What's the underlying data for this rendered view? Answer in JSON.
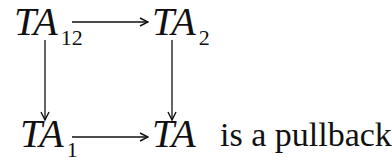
{
  "diagram": {
    "type": "commutative-square",
    "nodes": {
      "top_left": {
        "base": "TA",
        "sub": "12"
      },
      "top_right": {
        "base": "TA",
        "sub": "2"
      },
      "bottom_left": {
        "base": "TA",
        "sub": "1"
      },
      "bottom_right": {
        "base": "TA",
        "sub": ""
      }
    },
    "edges": [
      {
        "from": "top_left",
        "to": "top_right",
        "direction": "right"
      },
      {
        "from": "top_left",
        "to": "bottom_left",
        "direction": "down"
      },
      {
        "from": "top_right",
        "to": "bottom_right",
        "direction": "down"
      },
      {
        "from": "bottom_left",
        "to": "bottom_right",
        "direction": "right"
      }
    ],
    "caption": "is a pullback"
  },
  "colors": {
    "ink": "#111111",
    "background": "#ffffff"
  }
}
